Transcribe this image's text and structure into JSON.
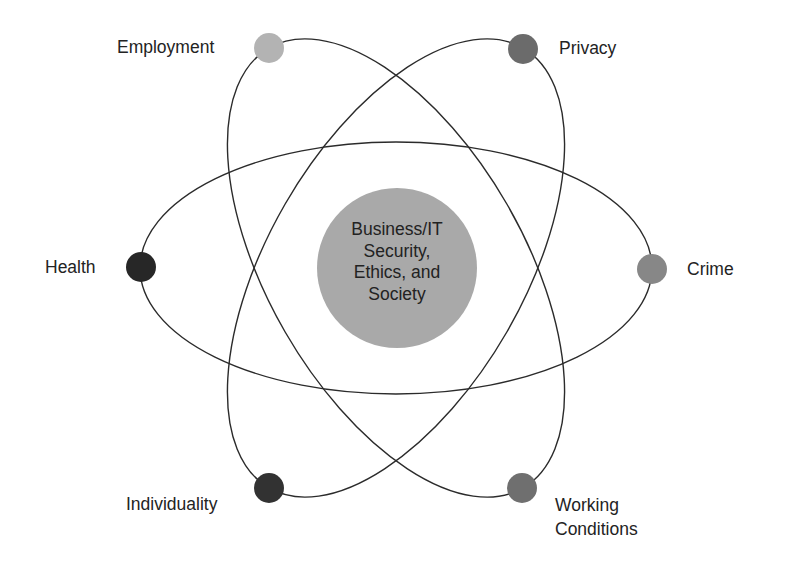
{
  "center": {
    "lines": [
      "Business/IT",
      "Security,",
      "Ethics, and",
      "Society"
    ],
    "fill": "#a9a9a9"
  },
  "nodes": [
    {
      "id": "employment",
      "label": "Employment",
      "fill": "#b3b3b3"
    },
    {
      "id": "privacy",
      "label": "Privacy",
      "fill": "#6b6b6b"
    },
    {
      "id": "health",
      "label": "Health",
      "fill": "#272727"
    },
    {
      "id": "crime",
      "label": "Crime",
      "fill": "#878787"
    },
    {
      "id": "individuality",
      "label": "Individuality",
      "fill": "#323232"
    },
    {
      "id": "working-conditions",
      "label_lines": [
        "Working",
        "Conditions"
      ],
      "fill": "#6f6f6f"
    }
  ],
  "orbit_stroke": "#2b2b2b"
}
